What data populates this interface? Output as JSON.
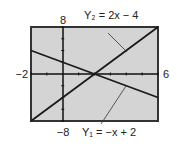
{
  "chart_data": {
    "type": "line",
    "title": "",
    "xlabel": "",
    "ylabel": "",
    "xlim": [
      -2,
      6
    ],
    "ylim": [
      -8,
      8
    ],
    "xscale": 1,
    "yscale": 2,
    "grid": false,
    "window_labels": {
      "xmin": "−2",
      "xmax": "6",
      "ymin": "−8",
      "ymax": "8"
    },
    "series": [
      {
        "name": "Y1",
        "label": "Y₁ = −x + 2",
        "equation": "-x + 2",
        "slope": -1,
        "intercept": 2,
        "x": [
          -2,
          6
        ],
        "y": [
          4,
          -4
        ]
      },
      {
        "name": "Y2",
        "label": "Y₂ = 2x − 4",
        "equation": "2x - 4",
        "slope": 2,
        "intercept": -4,
        "x": [
          -2,
          6
        ],
        "y": [
          -8,
          8
        ]
      }
    ],
    "intersection": {
      "x": 2,
      "y": 0
    },
    "colors": {
      "screen": "#d4d4d4",
      "frame": "#333333",
      "line": "#1a1a1a"
    }
  }
}
